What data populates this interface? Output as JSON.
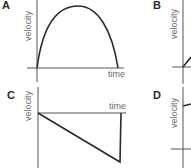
{
  "figure": {
    "panels": [
      {
        "label": "A",
        "ylabel": "velocity",
        "xlabel": "time",
        "shape": "arch: rises from origin to a peak then falls back to zero"
      },
      {
        "label": "B",
        "ylabel": "velocity",
        "xlabel": "",
        "shape": "straight line rising from origin"
      },
      {
        "label": "C",
        "ylabel": "velocity",
        "xlabel": "time",
        "shape": "straight line decreasing below zero, then vertical jump back to zero"
      },
      {
        "label": "D",
        "ylabel": "velocity",
        "xlabel": "",
        "shape": "starts at positive velocity near top"
      }
    ]
  },
  "colors": {
    "line": "#2b2b2b",
    "axis": "#555555",
    "text": "#6a6a6a"
  }
}
